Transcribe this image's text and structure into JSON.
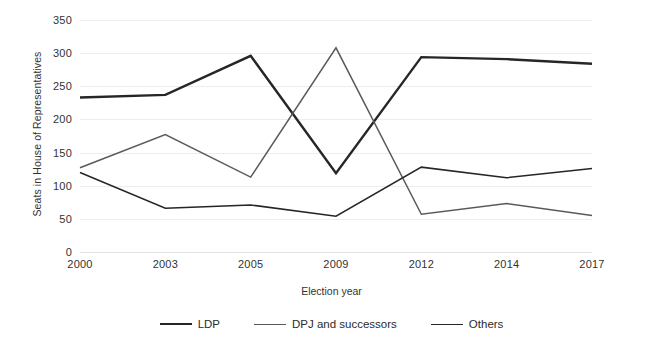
{
  "chart_data": {
    "type": "line",
    "title": "",
    "xlabel": "Election year",
    "ylabel": "Seats in House of Representatives",
    "categories": [
      "2000",
      "2003",
      "2005",
      "2009",
      "2012",
      "2014",
      "2017"
    ],
    "ylim": [
      0,
      350
    ],
    "yticks": [
      0,
      50,
      100,
      150,
      200,
      250,
      300,
      350
    ],
    "grid": true,
    "legend_position": "bottom",
    "series": [
      {
        "name": "LDP",
        "color": "#262626",
        "width": 2.4,
        "values": [
          233,
          237,
          296,
          119,
          294,
          291,
          284
        ]
      },
      {
        "name": "DPJ and successors",
        "color": "#5a5a5a",
        "width": 1.5,
        "values": [
          127,
          177,
          113,
          308,
          57,
          73,
          55
        ]
      },
      {
        "name": "Others",
        "color": "#262626",
        "width": 1.5,
        "values": [
          120,
          66,
          71,
          54,
          128,
          112,
          126
        ]
      }
    ]
  }
}
